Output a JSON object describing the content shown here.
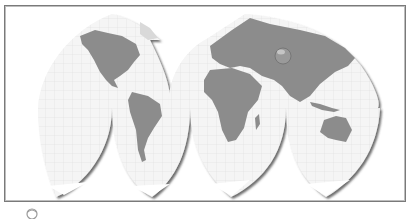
{
  "map": {
    "projection": "interrupted-goode-homolosine-style",
    "lobes": [
      "north-america",
      "south-america",
      "europe-africa",
      "asia-australia"
    ],
    "colors": {
      "land": "#8c8c8c",
      "ocean": "#f4f4f4",
      "graticule": "#dcdcdc",
      "frame": "#7a7a7a",
      "shadow": "#5a5a5a",
      "ice": "#ffffff"
    }
  },
  "footer": {
    "icon": "globe-icon",
    "caption": ""
  }
}
